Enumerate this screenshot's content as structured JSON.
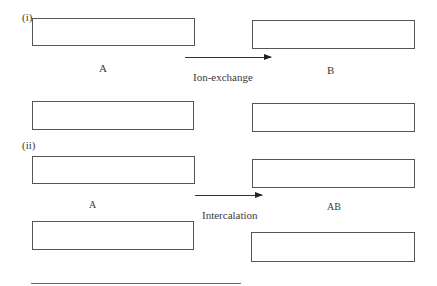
{
  "panels": [
    {
      "id": "i",
      "marker": "(i)",
      "left_label": "A",
      "right_label": "B",
      "process_label": "Ion-exchange"
    },
    {
      "id": "ii",
      "marker": "(ii)",
      "left_label": "A",
      "right_label": "AB",
      "process_label": "Intercalation"
    }
  ]
}
